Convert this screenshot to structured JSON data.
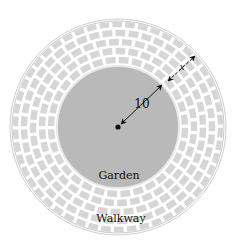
{
  "figure": {
    "center_label": "Garden",
    "ring_label": "Walkway",
    "radius_label": "10",
    "width_label": "x"
  },
  "colors": {
    "garden": "#b9b9b9",
    "brick": "#d6d6d6",
    "mortar": "#ffffff",
    "ring_border": "#c8c8c8",
    "ink": "#111111"
  }
}
